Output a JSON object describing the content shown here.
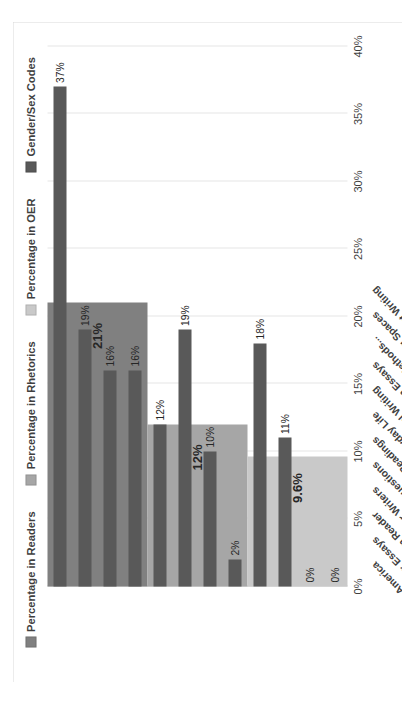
{
  "figure": {
    "background": "#ffffff",
    "border_color": "#d9d9d9"
  },
  "legend": {
    "position": "top-center",
    "items": [
      {
        "label": "Percentage in Readers",
        "color": "#808080"
      },
      {
        "label": "Percentage in Rhetorics",
        "color": "#a6a6a6"
      },
      {
        "label": "Percentage in OER",
        "color": "#c9c9c9"
      },
      {
        "label": "Gender/Sex Codes",
        "color": "#595959"
      }
    ]
  },
  "chart_data": {
    "type": "bar",
    "orientation": "horizontal",
    "title": "",
    "xlabel": "",
    "ylabel": "",
    "xlim": [
      0,
      40
    ],
    "grid": true,
    "tick_labels": [
      "0%",
      "5%",
      "10%",
      "15%",
      "20%",
      "25%",
      "30%",
      "35%",
      "40%"
    ],
    "tick_values": [
      0,
      5,
      10,
      15,
      20,
      25,
      30,
      35,
      40
    ],
    "categories": [
      "Rereading America",
      "Seagull Reader: Essays",
      "Longman Reader",
      "Readings for Writers",
      "Current Issues and Enduring Questions",
      "Norton Field Guide to Writing with Readings",
      "Composition of Everyday Life",
      "Strategies for Successful Writing",
      "88 Open Essays",
      "English Composition 1: Rhetorical Methods...",
      "Writing Spaces",
      "Bad Ideas About Writing"
    ],
    "series": [
      {
        "name": "Gender/Sex Codes",
        "color": "#595959",
        "values": [
          37,
          19,
          16,
          16,
          12,
          19,
          10,
          2,
          18,
          11,
          0,
          0
        ],
        "labels": [
          "37%",
          "19%",
          "16%",
          "16%",
          "12%",
          "19%",
          "10%",
          "2%",
          "18%",
          "11%",
          "0%",
          "0%"
        ]
      }
    ],
    "group_bands": [
      {
        "name": "Percentage in Readers",
        "color": "#808080",
        "value": 21,
        "label": "21%",
        "start_category": "Rereading America",
        "end_category": "Readings for Writers"
      },
      {
        "name": "Percentage in Rhetorics",
        "color": "#a6a6a6",
        "value": 12,
        "label": "12%",
        "start_category": "Current Issues and Enduring Questions",
        "end_category": "Strategies for Successful Writing"
      },
      {
        "name": "Percentage in OER",
        "color": "#c9c9c9",
        "value": 9.6,
        "label": "9.6%",
        "start_category": "88 Open Essays",
        "end_category": "Bad Ideas About Writing"
      }
    ]
  }
}
